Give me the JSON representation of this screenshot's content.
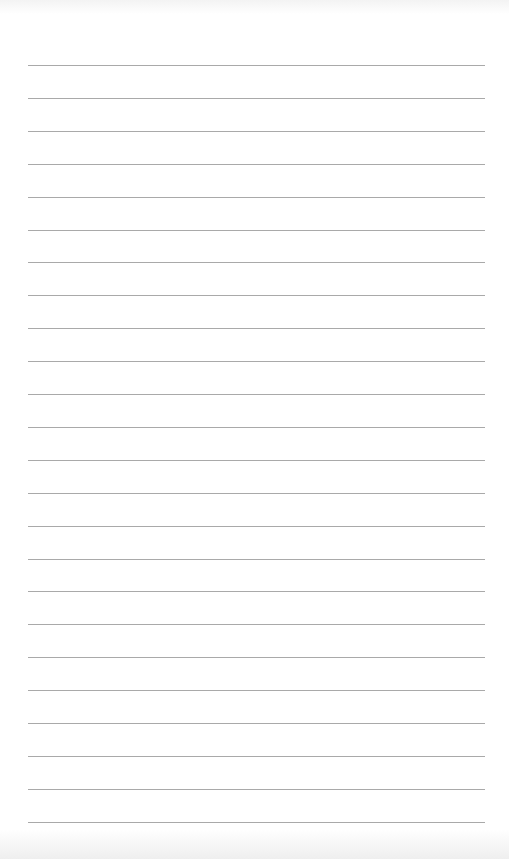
{
  "page": {
    "type": "lined-paper",
    "background_color": "#ffffff",
    "rule_color": "#a9a9a9",
    "rule_count": 24,
    "first_rule_y": 65,
    "rule_spacing": 32.9,
    "rule_left": 28,
    "rule_right": 485
  }
}
